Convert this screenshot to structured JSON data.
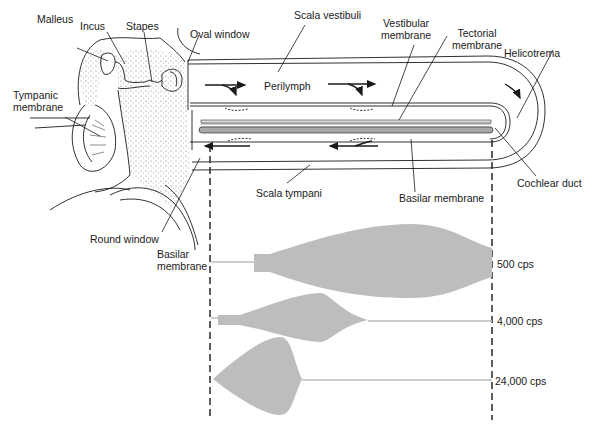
{
  "labels": {
    "malleus": "Malleus",
    "incus": "Incus",
    "stapes": "Stapes",
    "oval_window": "Oval window",
    "scala_vestibuli": "Scala vestibuli",
    "vestibular_membrane_1": "Vestibular",
    "vestibular_membrane_2": "membrane",
    "tectorial_membrane_1": "Tectorial",
    "tectorial_membrane_2": "membrane",
    "helicotrema": "Helicotrema",
    "tympanic_membrane_1": "Tympanic",
    "tympanic_membrane_2": "membrane",
    "perilymph": "Perilymph",
    "cochlear_duct": "Cochlear duct",
    "scala_tympani": "Scala tympani",
    "basilar_membrane": "Basilar membrane",
    "round_window": "Round window",
    "basilar_membrane_lower_1": "Basilar",
    "basilar_membrane_lower_2": "membrane"
  },
  "frequencies": [
    {
      "label": "500 cps",
      "peak_position": "near helicotrema (apex)"
    },
    {
      "label": "4,000 cps",
      "peak_position": "middle-base"
    },
    {
      "label": "24,000 cps",
      "peak_position": "near oval window (base)"
    }
  ],
  "colors": {
    "line": "#1a1a1a",
    "envelope_fill": "#bdbdbd",
    "basilar_fill": "#a8a8a8",
    "stipple": "#555555"
  }
}
